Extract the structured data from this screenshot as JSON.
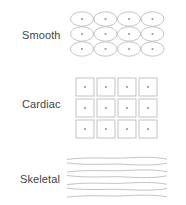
{
  "diagram": {
    "stroke_color": "#bdbdbd",
    "nucleus_color": "#9a9a9a",
    "label_color": "#444444",
    "sections": [
      {
        "label": "Smooth",
        "shape": "ellipse-grid",
        "rows": 3,
        "cols": 4,
        "has_nucleus": true
      },
      {
        "label": "Cardiac",
        "shape": "square-grid",
        "rows": 3,
        "cols": 4,
        "has_nucleus": true
      },
      {
        "label": "Skeletal",
        "shape": "wavy-fibers",
        "fiber_count": 7
      }
    ]
  }
}
